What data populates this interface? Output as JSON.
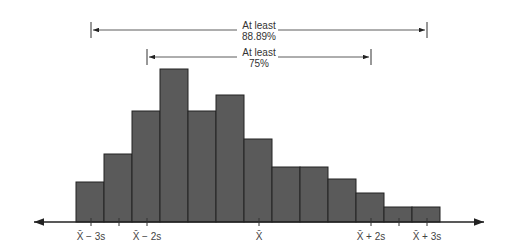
{
  "chart_data": {
    "type": "bar",
    "subtype": "histogram",
    "title": "",
    "xlabel": "",
    "ylabel": "",
    "grid": false,
    "legend": "none",
    "bar_color": "#5a5a5a",
    "bar_edge_color": "#222222",
    "bins": 13,
    "values": [
      40,
      68,
      111,
      153,
      111,
      127,
      83,
      55,
      55,
      43,
      29,
      15,
      15
    ],
    "x_ticks": [
      {
        "label": "X̄ − 3s",
        "position": 91
      },
      {
        "label": "",
        "position": 119
      },
      {
        "label": "X̄ − 2s",
        "position": 147
      },
      {
        "label": "X̄",
        "position": 259
      },
      {
        "label": "X̄ + 2s",
        "position": 371
      },
      {
        "label": "",
        "position": 399
      },
      {
        "label": "X̄ + 3s",
        "position": 427
      }
    ],
    "annotations": [
      {
        "line1": "At least",
        "line2": "88.89%",
        "from": "X̄ − 3s",
        "to": "X̄ + 3s"
      },
      {
        "line1": "At least",
        "line2": "75%",
        "from": "X̄ − 2s",
        "to": "X̄ + 2s"
      }
    ]
  }
}
